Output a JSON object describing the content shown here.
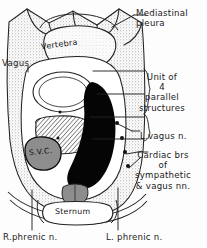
{
  "figure": {
    "style": "hand-drawn anatomical line illustration, black ink on white",
    "width": 207,
    "height": 248
  },
  "colors": {
    "ink": "#1b1b1b",
    "paper": "#fdfdfd",
    "stipple": "#9a9a9a",
    "stipple_light": "#c9c9c9",
    "fill_black": "#050505",
    "fill_gray": "#8d8d8d",
    "fill_gray_light": "#bdbdbd"
  },
  "outer_labels": [
    {
      "id": "mediastinal-pleura",
      "text": "Mediastinal\npleura",
      "x": 136,
      "y": 8,
      "align": "left"
    },
    {
      "id": "unit-of-4",
      "text": "Unit of\n4\nparallel\nstructures",
      "x": 150,
      "y": 72,
      "align": "center"
    },
    {
      "id": "left-vagus-nerve",
      "text": "L.vagus n.",
      "x": 140,
      "y": 132,
      "align": "left"
    },
    {
      "id": "cardiac-branches",
      "text": "Cardiac brs\nof\nsympathetic\n& vagus nn.",
      "x": 152,
      "y": 152,
      "align": "center"
    },
    {
      "id": "right-phrenic-nerve",
      "text": "R.phrenic n.",
      "x": 4,
      "y": 233,
      "align": "left"
    },
    {
      "id": "left-phrenic-nerve",
      "text": "L. phrenic n.",
      "x": 110,
      "y": 233,
      "align": "left"
    },
    {
      "id": "vagus",
      "text": "Vagus",
      "x": 3,
      "y": 61,
      "align": "left"
    }
  ],
  "inner_labels": [
    {
      "id": "vertebra",
      "text": "Vertebra",
      "x": 47,
      "y": 42,
      "rotate": -8
    },
    {
      "id": "superior-vena-cava",
      "text": "S.V.C.",
      "x": 29,
      "y": 150,
      "rotate": -6
    },
    {
      "id": "sternum",
      "text": "Sternum",
      "x": 58,
      "y": 214,
      "rotate": 0
    }
  ],
  "structures": [
    {
      "id": "vertebral-body",
      "label": "Vertebra",
      "fill": "stipple_light"
    },
    {
      "id": "trachea",
      "label": "Trachea",
      "fill": "paper"
    },
    {
      "id": "oesophagus-hatched",
      "label": "Hatched parallel structure",
      "fill": "hatch"
    },
    {
      "id": "superior-vena-cava",
      "label": "S.V.C.",
      "fill": "fill_gray"
    },
    {
      "id": "aortic-arch",
      "label": "Great vessel",
      "fill": "fill_black"
    },
    {
      "id": "thymus",
      "label": "Thymus",
      "fill": "fill_gray"
    },
    {
      "id": "sternum",
      "label": "Sternum",
      "fill": "paper"
    },
    {
      "id": "lung-field-right",
      "label": "Right lung",
      "fill": "stipple"
    },
    {
      "id": "lung-field-left",
      "label": "Left lung",
      "fill": "stipple"
    }
  ],
  "leader_lines": {
    "count": 9,
    "brace_items": 4
  }
}
